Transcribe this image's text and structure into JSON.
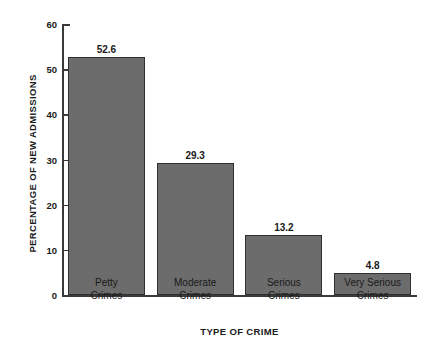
{
  "chart_data": {
    "type": "bar",
    "title": "",
    "categories": [
      "Petty Crimes",
      "Moderate Crimes",
      "Serious Crimes",
      "Very Serious Crimes"
    ],
    "category_lines": [
      [
        "Petty",
        "Crimes"
      ],
      [
        "Moderate",
        "Crimes"
      ],
      [
        "Serious",
        "Crimes"
      ],
      [
        "Very Serious",
        "Crimes"
      ]
    ],
    "values": [
      52.6,
      29.3,
      13.2,
      4.8
    ],
    "value_labels": [
      "52.6",
      "29.3",
      "13.2",
      "4.8"
    ],
    "xlabel": "TYPE OF CRIME",
    "ylabel": "PERCENTAGE OF NEW ADMISSIONS",
    "ylim": [
      0,
      60
    ],
    "yticks": [
      0,
      10,
      20,
      30,
      40,
      50,
      60
    ],
    "ytick_labels": [
      "0",
      "10",
      "20",
      "30",
      "40",
      "50",
      "60"
    ],
    "grid": false,
    "legend": null,
    "colors": {
      "bar_fill": "#6c6c6c",
      "bar_border": "#303030",
      "axis": "#3a3a3a",
      "text": "#1a1a1a",
      "background": "#ffffff"
    }
  }
}
